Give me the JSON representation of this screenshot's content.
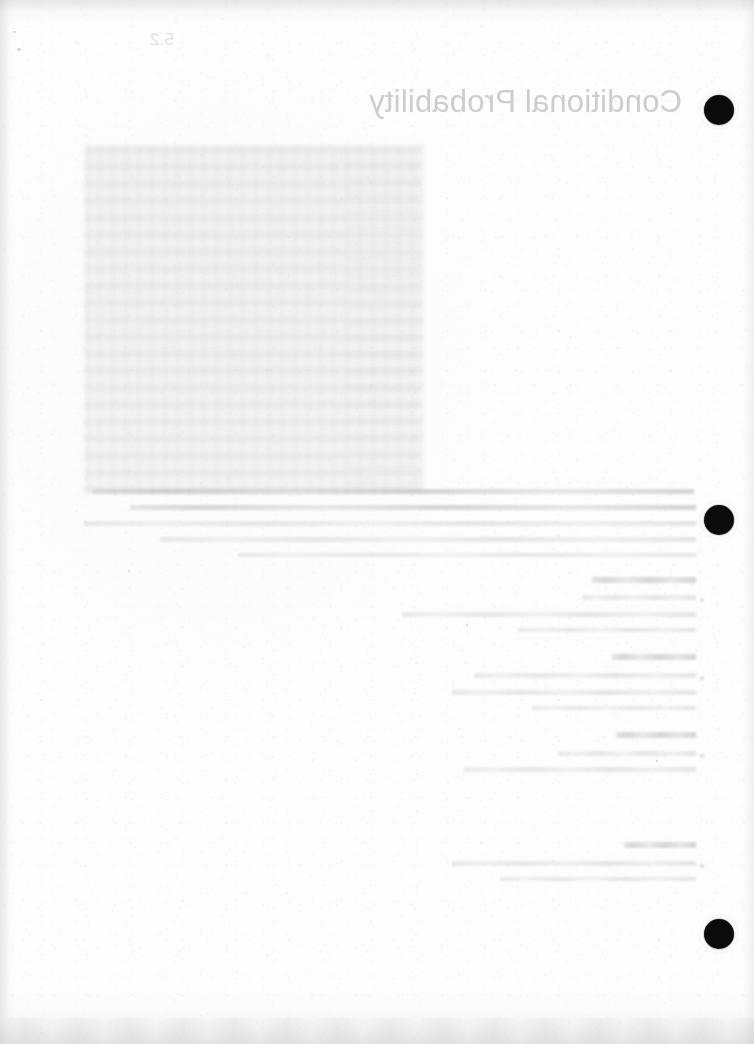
{
  "document": {
    "type": "scanned-page-verso",
    "description": "Blank back side of a scanned three-hole-punched notebook page showing reverse-side bleed-through",
    "paper_color": "#fcfcfc",
    "bleed_color": "#b9b9bd",
    "punch_hole_color": "#0b0b0b"
  },
  "bleed_through": {
    "note": "Text visible is mirrored show-through from the reverse side of the sheet",
    "chapter_number": "5.2",
    "title": "Conditional Probability",
    "figure_block_caption": "",
    "sections": [
      {
        "heading": "Definition",
        "lines": 2
      },
      {
        "heading": "Example",
        "lines": 2
      },
      {
        "heading": "Theorem",
        "lines": 2
      },
      {
        "heading": "Proof",
        "lines": 2
      }
    ],
    "paragraph_line_count": 5
  },
  "punch_holes": [
    {
      "label": "top-punch-hole",
      "cx": 719,
      "cy": 110,
      "d": 30
    },
    {
      "label": "middle-punch-hole",
      "cx": 719,
      "cy": 520,
      "d": 30
    },
    {
      "label": "bottom-punch-hole",
      "cx": 719,
      "cy": 934,
      "d": 30
    }
  ]
}
